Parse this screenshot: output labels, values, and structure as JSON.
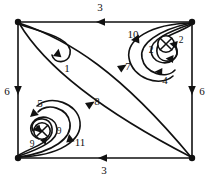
{
  "figure": {
    "type": "directed-graph-phase-portrait",
    "background": "#ffffff",
    "stroke_color": "#111111",
    "vertices": [
      {
        "id": "v-top-left",
        "name": "vertex-top-left",
        "x": 18,
        "y": 22,
        "kind": "filled-dot"
      },
      {
        "id": "v-top-right",
        "name": "vertex-top-right",
        "x": 192,
        "y": 22,
        "kind": "filled-dot"
      },
      {
        "id": "v-bottom-left",
        "name": "vertex-bottom-left",
        "x": 18,
        "y": 158,
        "kind": "filled-dot"
      },
      {
        "id": "v-bottom-right",
        "name": "vertex-bottom-right",
        "x": 192,
        "y": 158,
        "kind": "filled-dot"
      },
      {
        "id": "sing-right",
        "name": "singular-point-right",
        "x": 166,
        "y": 44,
        "kind": "crossed-circle"
      },
      {
        "id": "sing-left",
        "name": "singular-point-left",
        "x": 42,
        "y": 131,
        "kind": "crossed-circle"
      }
    ],
    "edge_labels": {
      "top": "3",
      "bottom": "3",
      "left": "6",
      "right": "6",
      "diagonal_upper": "7",
      "diagonal_lower": "8",
      "loop_top_left": "1",
      "spiral_right_outer": "10",
      "spiral_right_inner_left": "2",
      "spiral_right_inner_right": "2",
      "spiral_right_bottom": "4",
      "spiral_left_outer": "5",
      "spiral_left_inner_left": "9",
      "spiral_left_inner_right": "9",
      "spiral_left_bottom": "11"
    },
    "label_positions": [
      {
        "key": "top",
        "text": "3",
        "x": 100,
        "y": 11
      },
      {
        "key": "bottom",
        "text": "3",
        "x": 104,
        "y": 174
      },
      {
        "key": "left",
        "text": "6",
        "x": 7,
        "y": 92
      },
      {
        "key": "right",
        "text": "6",
        "x": 202,
        "y": 92
      },
      {
        "key": "diagonal_upper",
        "text": "7",
        "x": 126,
        "y": 68
      },
      {
        "key": "diagonal_lower",
        "text": "8",
        "x": 95,
        "y": 104
      },
      {
        "key": "loop_top_left",
        "text": "1",
        "x": 67,
        "y": 70
      },
      {
        "key": "spiral_right_outer",
        "text": "10",
        "x": 134,
        "y": 36
      },
      {
        "key": "spiral_right_inner_left",
        "text": "2",
        "x": 152,
        "y": 52
      },
      {
        "key": "spiral_right_inner_right",
        "text": "2",
        "x": 180,
        "y": 42
      },
      {
        "key": "spiral_right_bottom",
        "text": "4",
        "x": 165,
        "y": 80
      },
      {
        "key": "spiral_left_outer",
        "text": "5",
        "x": 40,
        "y": 105
      },
      {
        "key": "spiral_left_inner_left",
        "text": "9",
        "x": 33,
        "y": 143
      },
      {
        "key": "spiral_left_inner_right",
        "text": "9",
        "x": 58,
        "y": 132
      },
      {
        "key": "spiral_left_bottom",
        "text": "11",
        "x": 79,
        "y": 143
      }
    ],
    "arrow_directions": {
      "top": "leftward",
      "bottom": "leftward",
      "left": "downward",
      "right": "downward",
      "diagonal_upper": "down-left",
      "diagonal_lower": "down-left"
    }
  }
}
